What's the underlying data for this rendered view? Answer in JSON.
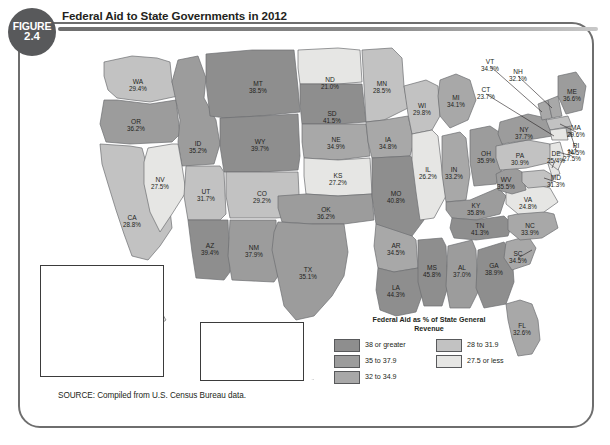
{
  "figure": {
    "label": "FIGURE",
    "number": "2.4"
  },
  "title": "Federal Aid to State Governments in 2012",
  "source": "SOURCE: Compiled from U.S. Census Bureau data.",
  "legend": {
    "title_line1": "Federal Aid as % of State General",
    "title_line2": "Revenue",
    "classes": [
      {
        "label": "38 or greater",
        "color": "#8e8e8e"
      },
      {
        "label": "35 to 37.9",
        "color": "#9c9c9c"
      },
      {
        "label": "32 to 34.9",
        "color": "#a8a8a8"
      },
      {
        "label": "28 to 31.9",
        "color": "#c2c2c2"
      },
      {
        "label": "27.5 or less",
        "color": "#e6e6e4"
      }
    ]
  },
  "insets": {
    "ak_name": "AK",
    "hi_name": "HI"
  },
  "chart_data": {
    "type": "heatmap",
    "title": "Federal Aid to State Governments in 2012",
    "unit": "% of State General Revenue",
    "legend_bins": [
      "38 or greater",
      "35 to 37.9",
      "32 to 34.9",
      "28 to 31.9",
      "27.5 or less"
    ],
    "states": [
      {
        "code": "WA",
        "value": "29.4%",
        "bin": 3
      },
      {
        "code": "OR",
        "value": "36.2%",
        "bin": 1
      },
      {
        "code": "CA",
        "value": "28.8%",
        "bin": 3
      },
      {
        "code": "NV",
        "value": "27.5%",
        "bin": 4
      },
      {
        "code": "ID",
        "value": "35.2%",
        "bin": 1
      },
      {
        "code": "MT",
        "value": "38.5%",
        "bin": 0
      },
      {
        "code": "WY",
        "value": "39.7%",
        "bin": 0
      },
      {
        "code": "UT",
        "value": "31.7%",
        "bin": 3
      },
      {
        "code": "AZ",
        "value": "39.4%",
        "bin": 0
      },
      {
        "code": "NM",
        "value": "37.9%",
        "bin": 1
      },
      {
        "code": "CO",
        "value": "29.2%",
        "bin": 3
      },
      {
        "code": "ND",
        "value": "21.0%",
        "bin": 4
      },
      {
        "code": "SD",
        "value": "41.5%",
        "bin": 0
      },
      {
        "code": "NE",
        "value": "34.9%",
        "bin": 2
      },
      {
        "code": "KS",
        "value": "27.2%",
        "bin": 4
      },
      {
        "code": "OK",
        "value": "36.2%",
        "bin": 1
      },
      {
        "code": "TX",
        "value": "35.1%",
        "bin": 1
      },
      {
        "code": "MN",
        "value": "28.5%",
        "bin": 3
      },
      {
        "code": "IA",
        "value": "34.8%",
        "bin": 2
      },
      {
        "code": "MO",
        "value": "40.8%",
        "bin": 0
      },
      {
        "code": "AR",
        "value": "34.5%",
        "bin": 2
      },
      {
        "code": "LA",
        "value": "44.3%",
        "bin": 0
      },
      {
        "code": "WI",
        "value": "29.8%",
        "bin": 3
      },
      {
        "code": "IL",
        "value": "26.2%",
        "bin": 4
      },
      {
        "code": "MI",
        "value": "34.1%",
        "bin": 2
      },
      {
        "code": "IN",
        "value": "33.2%",
        "bin": 2
      },
      {
        "code": "OH",
        "value": "35.9%",
        "bin": 1
      },
      {
        "code": "KY",
        "value": "35.8%",
        "bin": 1
      },
      {
        "code": "TN",
        "value": "41.3%",
        "bin": 0
      },
      {
        "code": "MS",
        "value": "45.8%",
        "bin": 0
      },
      {
        "code": "AL",
        "value": "37.0%",
        "bin": 1
      },
      {
        "code": "GA",
        "value": "38.9%",
        "bin": 0
      },
      {
        "code": "FL",
        "value": "32.6%",
        "bin": 2
      },
      {
        "code": "SC",
        "value": "34.5%",
        "bin": 2
      },
      {
        "code": "NC",
        "value": "33.9%",
        "bin": 2
      },
      {
        "code": "VA",
        "value": "24.8%",
        "bin": 4
      },
      {
        "code": "WV",
        "value": "35.5%",
        "bin": 1
      },
      {
        "code": "MD",
        "value": "31.3%",
        "bin": 3
      },
      {
        "code": "DE",
        "value": "25.4%",
        "bin": 4
      },
      {
        "code": "PA",
        "value": "30.9%",
        "bin": 3
      },
      {
        "code": "NJ",
        "value": "27.5%",
        "bin": 4
      },
      {
        "code": "NY",
        "value": "37.7%",
        "bin": 1
      },
      {
        "code": "CT",
        "value": "23.7%",
        "bin": 4
      },
      {
        "code": "RI",
        "value": "34.5%",
        "bin": 2
      },
      {
        "code": "MA",
        "value": "29.6%",
        "bin": 3
      },
      {
        "code": "VT",
        "value": "34.9%",
        "bin": 2
      },
      {
        "code": "NH",
        "value": "32.1%",
        "bin": 2
      },
      {
        "code": "ME",
        "value": "36.6%",
        "bin": 1
      },
      {
        "code": "AK",
        "value": "20.0%",
        "bin": 4
      },
      {
        "code": "HI",
        "value": "23.6%",
        "bin": 4
      }
    ]
  }
}
